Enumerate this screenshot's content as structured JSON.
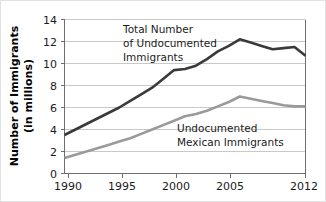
{
  "chart_data": {
    "type": "line",
    "title": "",
    "subtitle": "",
    "xlabel": "",
    "ylabel": "Number of Immigrants (in millions)",
    "ylabel_line1": "Number of Immigrants",
    "ylabel_line2": "(in millions)",
    "xlim": [
      1990,
      2012
    ],
    "ylim": [
      0,
      14
    ],
    "grid": "horizontal",
    "legend_position": "inline-annotations",
    "y_ticks": [
      0,
      2,
      4,
      6,
      8,
      10,
      12,
      14
    ],
    "y_tick_labels": [
      "0",
      "2",
      "4",
      "6",
      "8",
      "10",
      "12",
      "14"
    ],
    "x_ticks": [
      1990,
      1995,
      2000,
      2005,
      2012
    ],
    "x_tick_labels": [
      "1990",
      "1995",
      "2000",
      "2005",
      "2012"
    ],
    "x": [
      1990,
      1991,
      1992,
      1993,
      1994,
      1995,
      1996,
      1997,
      1998,
      1999,
      2000,
      2001,
      2002,
      2003,
      2004,
      2005,
      2006,
      2007,
      2008,
      2009,
      2010,
      2011,
      2012
    ],
    "series": [
      {
        "name": "Total Number of Undocumented Immigrants",
        "color": "#3a3a3a",
        "values": [
          3.5,
          4.0,
          4.5,
          5.0,
          5.5,
          6.0,
          6.6,
          7.2,
          7.8,
          8.6,
          9.4,
          9.5,
          9.8,
          10.4,
          11.1,
          11.6,
          12.2,
          11.9,
          11.6,
          11.3,
          11.4,
          11.5,
          10.7
        ]
      },
      {
        "name": "Undocumented Mexican Immigrants",
        "color": "#9a9a9a",
        "values": [
          1.4,
          1.7,
          2.0,
          2.3,
          2.6,
          2.9,
          3.2,
          3.6,
          4.0,
          4.4,
          4.8,
          5.2,
          5.4,
          5.7,
          6.1,
          6.5,
          7.0,
          6.8,
          6.6,
          6.4,
          6.2,
          6.1,
          6.1
        ]
      }
    ],
    "annotations": [
      {
        "id": "annotation-total",
        "lines": [
          "Total Number",
          "of Undocumented",
          "Immigrants"
        ],
        "color": "#1b1b1b"
      },
      {
        "id": "annotation-mexican",
        "lines": [
          "Undocumented",
          "Mexican Immigrants"
        ],
        "color": "#1b1b1b"
      }
    ]
  }
}
